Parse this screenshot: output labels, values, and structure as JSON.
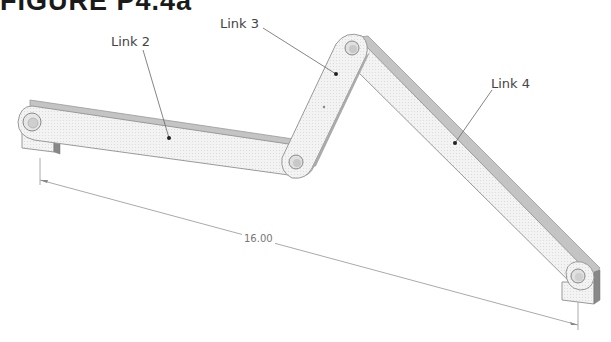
{
  "figure": {
    "title": "FIGURE P4.4a"
  },
  "links": [
    {
      "name": "Link 2"
    },
    {
      "name": "Link 3"
    },
    {
      "name": "Link 4"
    }
  ],
  "dimension": {
    "value": "16.00"
  },
  "colors": {
    "link_face": "#f1f1f1",
    "link_edge": "#9a9a9a",
    "link_top": "#c8c8c8",
    "leader": "#555555",
    "dimension_line": "#aaaaaa"
  }
}
